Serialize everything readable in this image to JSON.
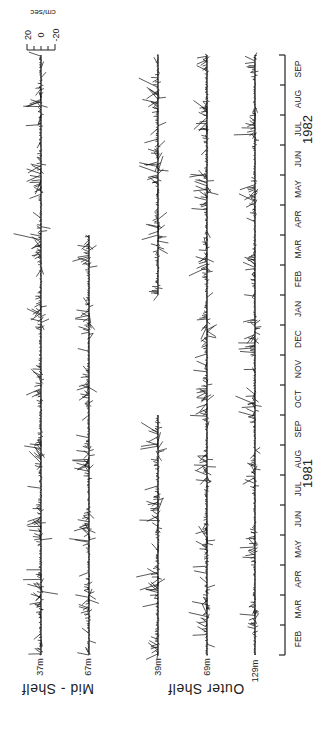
{
  "chart_data": {
    "type": "line",
    "title": "",
    "subtitle": "Current vector time series (stick plots)",
    "xlabel": "",
    "ylabel": "",
    "scale": {
      "unit_label": "cm/sec",
      "ticks": [
        "20",
        "0",
        "-20"
      ],
      "range": [
        -20,
        20
      ]
    },
    "years": [
      "1981",
      "1982"
    ],
    "months": [
      "FEB",
      "MAR",
      "APR",
      "MAY",
      "JUN",
      "JUL",
      "AUG",
      "SEP",
      "OCT",
      "NOV",
      "DEC",
      "JAN",
      "FEB",
      "MAR",
      "APR",
      "MAY",
      "JUN",
      "JUL",
      "AUG",
      "SEP"
    ],
    "groups": [
      {
        "name": "Mid - Shelf",
        "series": [
          "37m",
          "67m"
        ]
      },
      {
        "name": "Outer Shelf",
        "series": [
          "39m",
          "69m",
          "129m"
        ]
      }
    ],
    "series": [
      {
        "name": "37m",
        "group": "Mid-Shelf",
        "coverage": [
          [
            "FEB 1981",
            "SEP 1982"
          ]
        ],
        "seed": 11,
        "amp": 1.0
      },
      {
        "name": "67m",
        "group": "Mid-Shelf",
        "coverage": [
          [
            "FEB 1981",
            "MAR 1982"
          ]
        ],
        "seed": 23,
        "amp": 0.9
      },
      {
        "name": "39m",
        "group": "Outer Shelf",
        "coverage": [
          [
            "FEB 1981",
            "SEP 1981"
          ],
          [
            "FEB 1982",
            "SEP 1982"
          ]
        ],
        "seed": 37,
        "amp": 1.1
      },
      {
        "name": "69m",
        "group": "Outer Shelf",
        "coverage": [
          [
            "FEB 1981",
            "JAN 1982"
          ],
          [
            "FEB 1982",
            "SEP 1982"
          ]
        ],
        "seed": 41,
        "amp": 1.0
      },
      {
        "name": "129m",
        "group": "Outer Shelf",
        "coverage": [
          [
            "FEB 1981",
            "JAN 1982"
          ],
          [
            "FEB 1982",
            "SEP 1982"
          ]
        ],
        "seed": 53,
        "amp": 0.8
      }
    ],
    "layout": {
      "grid": false,
      "legend": "none",
      "orientation": "rotated-90"
    }
  },
  "labels": {
    "scale_unit": "cm/sec",
    "scale_pos": "20",
    "scale_zero": "0",
    "scale_neg": "-20",
    "year_1981": "1981",
    "year_1982": "1982",
    "depth_37": "37m",
    "depth_67": "67m",
    "depth_39": "39m",
    "depth_69": "69m",
    "depth_129": "129m",
    "group_mid": "Mid - Shelf",
    "group_outer": "Outer Shelf"
  }
}
